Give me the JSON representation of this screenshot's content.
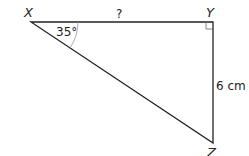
{
  "diagram": {
    "type": "right-triangle",
    "vertices": {
      "X": {
        "label": "X"
      },
      "Y": {
        "label": "Y"
      },
      "Z": {
        "label": "Z"
      }
    },
    "angle_x": {
      "label": "35°",
      "value": 35
    },
    "side_xy": {
      "label": "?"
    },
    "side_yz": {
      "label": "6 cm"
    },
    "right_angle_at": "Y",
    "colors": {
      "line": "#222222",
      "arc": "#888888"
    }
  }
}
